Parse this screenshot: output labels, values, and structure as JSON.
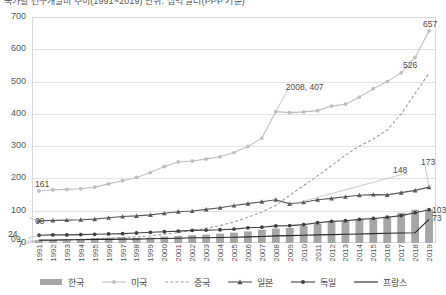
{
  "title": "국가별 연구개발비 추이(1991~2019)  단위: 십억 달러(PPP 기준)",
  "legend": {
    "position": "bottom",
    "items": [
      {
        "label": "한국",
        "marker": "bar",
        "color": "#a6a6a6"
      },
      {
        "label": "미국",
        "marker": "line-circle-light",
        "color": "#bfbfbf"
      },
      {
        "label": "중국",
        "marker": "dashed",
        "color": "#9e9e9e"
      },
      {
        "label": "일본",
        "marker": "line-triangle",
        "color": "#595959"
      },
      {
        "label": "독일",
        "marker": "line-circle",
        "color": "#404040"
      },
      {
        "label": "프랑스",
        "marker": "line-plain",
        "color": "#262626"
      }
    ]
  },
  "axes": {
    "y_ticks": [
      0,
      100,
      200,
      300,
      400,
      500,
      600,
      700
    ],
    "ylim": [
      0,
      700
    ],
    "x_ticks": [
      "1991",
      "1992",
      "1993",
      "1994",
      "1995",
      "1996",
      "1997",
      "1998",
      "1999",
      "2000",
      "2001",
      "2002",
      "2003",
      "2004",
      "2005",
      "2006",
      "2007",
      "2008",
      "2009",
      "2010",
      "2011",
      "2012",
      "2013",
      "2014",
      "2015",
      "2016",
      "2017",
      "2018",
      "2019"
    ]
  },
  "annotations": [
    {
      "text": "2008, 407",
      "series": "미국",
      "x": "2008",
      "y": 407
    },
    {
      "text": "161",
      "series": "중국",
      "x": "1991",
      "y": 161
    },
    {
      "text": "69",
      "series": "미국",
      "x": "1991",
      "y": 69
    },
    {
      "text": "24",
      "series": "일본",
      "x": "1991",
      "y": 24
    },
    {
      "text": "9",
      "series": "독일",
      "x": "1991",
      "y": 9
    },
    {
      "text": "0",
      "series": "한국",
      "x": "1991",
      "y": 0
    },
    {
      "text": "7",
      "series": "프랑스",
      "x": "1991",
      "y": 7
    },
    {
      "text": "657",
      "series": "미국",
      "x": "2019",
      "y": 657
    },
    {
      "text": "526",
      "series": "중국",
      "x": "2019",
      "y": 526
    },
    {
      "text": "173",
      "series": "일본",
      "x": "2019",
      "y": 173
    },
    {
      "text": "148",
      "series": "중국-2009",
      "x": "2009",
      "y": 148
    },
    {
      "text": "103",
      "series": "독일",
      "x": "2019",
      "y": 103
    },
    {
      "text": "73",
      "series": "프랑스",
      "x": "2019",
      "y": 73
    }
  ],
  "chart_data": {
    "type": "bar",
    "title": "국가별 연구개발비 추이(1991~2019)  단위: 십억 달러(PPP 기준)",
    "xlabel": "",
    "ylabel": "",
    "ylim": [
      0,
      700
    ],
    "grid": true,
    "legend_position": "bottom",
    "categories": [
      "1991",
      "1992",
      "1993",
      "1994",
      "1995",
      "1996",
      "1997",
      "1998",
      "1999",
      "2000",
      "2001",
      "2002",
      "2003",
      "2004",
      "2005",
      "2006",
      "2007",
      "2008",
      "2009",
      "2010",
      "2011",
      "2012",
      "2013",
      "2014",
      "2015",
      "2016",
      "2017",
      "2018",
      "2019"
    ],
    "series": [
      {
        "name": "한국",
        "type": "bar",
        "color": "#a6a6a6",
        "values": [
          8,
          9,
          10,
          12,
          14,
          16,
          17,
          16,
          17,
          20,
          22,
          24,
          26,
          29,
          32,
          36,
          41,
          45,
          47,
          53,
          60,
          65,
          70,
          74,
          77,
          82,
          93,
          103,
          103
        ]
      },
      {
        "name": "미국",
        "type": "line",
        "marker": "circle",
        "color": "#bfbfbf",
        "values": [
          161,
          165,
          166,
          168,
          173,
          183,
          193,
          203,
          218,
          237,
          251,
          254,
          260,
          267,
          280,
          299,
          325,
          407,
          404,
          406,
          410,
          424,
          430,
          452,
          478,
          500,
          527,
          575,
          657
        ]
      },
      {
        "name": "중국",
        "type": "line",
        "marker": "none",
        "dash": true,
        "color": "#9e9e9e",
        "values": [
          7,
          8,
          9,
          11,
          13,
          15,
          17,
          19,
          22,
          27,
          32,
          39,
          46,
          54,
          65,
          80,
          96,
          116,
          148,
          178,
          208,
          239,
          272,
          300,
          322,
          350,
          400,
          463,
          526
        ]
      },
      {
        "name": "일본",
        "type": "line",
        "marker": "triangle",
        "color": "#595959",
        "values": [
          69,
          70,
          71,
          72,
          74,
          78,
          82,
          84,
          87,
          92,
          97,
          99,
          104,
          109,
          116,
          122,
          128,
          134,
          121,
          126,
          134,
          138,
          143,
          148,
          150,
          149,
          156,
          163,
          173
        ]
      },
      {
        "name": "독일",
        "type": "line",
        "marker": "circle",
        "color": "#404040",
        "values": [
          24,
          25,
          25,
          26,
          27,
          28,
          29,
          31,
          33,
          35,
          37,
          39,
          40,
          41,
          43,
          47,
          49,
          53,
          54,
          57,
          63,
          67,
          69,
          73,
          76,
          80,
          85,
          94,
          103
        ]
      },
      {
        "name": "프랑스",
        "type": "line",
        "marker": "none",
        "color": "#262626",
        "values": [
          9,
          9,
          10,
          10,
          11,
          11,
          12,
          12,
          13,
          14,
          15,
          16,
          16,
          17,
          18,
          19,
          20,
          22,
          23,
          24,
          25,
          26,
          27,
          28,
          29,
          30,
          31,
          32,
          73
        ]
      }
    ]
  }
}
